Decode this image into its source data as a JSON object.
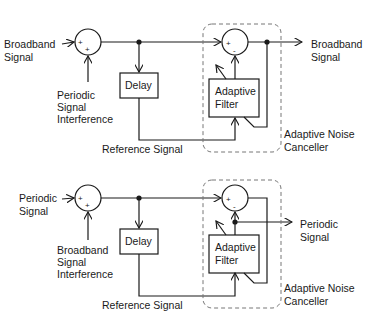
{
  "diagrams": [
    {
      "name": "noise-cancellation",
      "input_primary": [
        "Broadband",
        "Signal"
      ],
      "input_interference": [
        "Periodic",
        "Signal",
        "Interference"
      ],
      "summer1_signs": [
        "+",
        "+"
      ],
      "delay_label": "Delay",
      "reference_label": "Reference Signal",
      "filter_label": [
        "Adaptive",
        "Filter"
      ],
      "summer2_signs": [
        "+",
        "-"
      ],
      "output_label": [
        "Broadband",
        "Signal"
      ],
      "canceller_label": [
        "Adaptive Noise",
        "Canceller"
      ]
    },
    {
      "name": "periodic-signal-extraction",
      "input_primary": [
        "Periodic",
        "Signal"
      ],
      "input_interference": [
        "Broadband",
        "Signal",
        "Interference"
      ],
      "summer1_signs": [
        "+",
        "+"
      ],
      "delay_label": "Delay",
      "reference_label": "Reference Signal",
      "filter_label": [
        "Adaptive",
        "Filter"
      ],
      "summer2_signs": [
        "+",
        "-"
      ],
      "output_label": [
        "Periodic",
        "Signal"
      ],
      "canceller_label": [
        "Adaptive Noise",
        "Canceller"
      ]
    }
  ]
}
